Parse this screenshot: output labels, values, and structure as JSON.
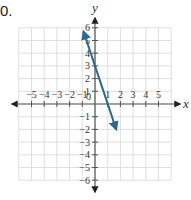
{
  "problem": {
    "label": "0."
  },
  "colors": {
    "grid": "#d6d6d6",
    "axis": "#555555",
    "line": "#2b6a8e",
    "text": "#333333"
  },
  "chart_data": {
    "type": "line",
    "title": "",
    "xlabel": "x",
    "ylabel": "y",
    "xlim": [
      -6,
      6
    ],
    "ylim": [
      -6,
      6
    ],
    "grid": true,
    "x_ticks": [
      -5,
      -4,
      -3,
      -2,
      -1,
      1,
      2,
      3,
      4,
      5
    ],
    "y_ticks": [
      -6,
      -5,
      -4,
      -3,
      -2,
      -1,
      1,
      2,
      3,
      4,
      5,
      6
    ],
    "origin_label": "0",
    "series": [
      {
        "name": "y = -3x + 3",
        "slope": -3,
        "intercept": 3,
        "x": [
          -0.9,
          1.67
        ],
        "y": [
          5.7,
          -2.0
        ],
        "arrows": "both"
      }
    ]
  }
}
